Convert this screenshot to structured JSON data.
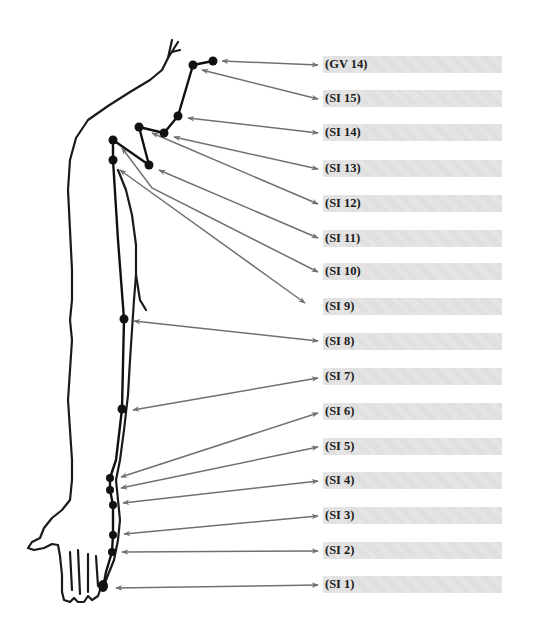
{
  "diagram": {
    "colors": {
      "outline": "#1a1a1a",
      "meridian": "#111111",
      "arrow": "#707070",
      "bar": "#dcdcdc",
      "label_text": "#1a1a1a"
    },
    "points": [
      {
        "id": "GV 14",
        "label": "(GV 14)",
        "x": 213,
        "y": 61,
        "label_y": 56
      },
      {
        "id": "SI 15",
        "label": "(SI 15)",
        "x": 193,
        "y": 65,
        "label_y": 90
      },
      {
        "id": "SI 14",
        "label": "(SI 14)",
        "x": 178,
        "y": 116,
        "label_y": 124
      },
      {
        "id": "SI 13",
        "label": "(SI 13)",
        "x": 164,
        "y": 133,
        "label_y": 160
      },
      {
        "id": "SI 12",
        "label": "(SI 12)",
        "x": 139,
        "y": 127,
        "label_y": 195
      },
      {
        "id": "SI 11",
        "label": "(SI 11)",
        "x": 149,
        "y": 165,
        "label_y": 230
      },
      {
        "id": "SI 10",
        "label": "(SI 10)",
        "x": 113,
        "y": 140,
        "label_y": 263
      },
      {
        "id": "SI 9",
        "label": "(SI 9)",
        "x": 113,
        "y": 160,
        "label_y": 298
      },
      {
        "id": "SI 8",
        "label": "(SI 8)",
        "x": 124,
        "y": 319,
        "label_y": 333
      },
      {
        "id": "SI 7",
        "label": "(SI 7)",
        "x": 122,
        "y": 409,
        "label_y": 368
      },
      {
        "id": "SI 6",
        "label": "(SI 6)",
        "x": 110,
        "y": 478,
        "label_y": 403
      },
      {
        "id": "SI 5",
        "label": "(SI 5)",
        "x": 110,
        "y": 490,
        "label_y": 438
      },
      {
        "id": "SI 4",
        "label": "(SI 4)",
        "x": 113,
        "y": 505,
        "label_y": 472
      },
      {
        "id": "SI 3",
        "label": "(SI 3)",
        "x": 113,
        "y": 535,
        "label_y": 507
      },
      {
        "id": "SI 2",
        "label": "(SI 2)",
        "x": 112,
        "y": 552,
        "label_y": 542
      },
      {
        "id": "SI 1",
        "label": "(SI 1)",
        "x": 103,
        "y": 588,
        "label_y": 576
      }
    ]
  }
}
